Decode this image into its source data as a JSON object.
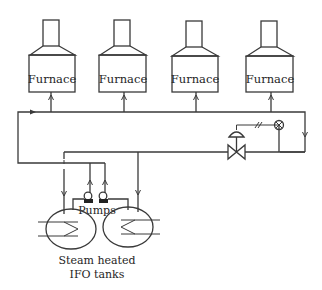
{
  "diagram": {
    "type": "process-flow",
    "title": "",
    "colors": {
      "line": "#3a3a3a",
      "text": "#1e1e1e",
      "background": "#ffffff"
    },
    "furnaces": [
      {
        "label": "Furnace",
        "x": 29
      },
      {
        "label": "Furnace",
        "x": 99
      },
      {
        "label": "Furnace",
        "x": 172
      },
      {
        "label": "Furnace",
        "x": 246
      }
    ],
    "pumps": {
      "label": "Pumps",
      "count": 2
    },
    "tanks": {
      "label_line1": "Steam heated",
      "label_line2": "IFO tanks",
      "count": 2
    },
    "components": [
      "supply-ring-main",
      "return-line",
      "control-valve",
      "pressure-instrument",
      "flow-arrows"
    ]
  }
}
